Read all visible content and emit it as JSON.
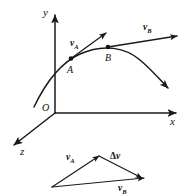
{
  "figure": {
    "type": "physics-vector-diagram",
    "background_color": "#ffffff",
    "stroke_color": "#1a1a1a"
  },
  "axes": {
    "y_label": "y",
    "x_label": "x",
    "z_label": "z",
    "origin_label": "O"
  },
  "curve": {
    "description": "trajectory-path",
    "points": [
      "A",
      "B"
    ]
  },
  "points": {
    "a_label": "A",
    "b_label": "B"
  },
  "vectors": {
    "v_a": {
      "symbol": "v",
      "subscript": "A"
    },
    "v_b": {
      "symbol": "v",
      "subscript": "B"
    }
  },
  "triangle": {
    "v_a": {
      "symbol": "v",
      "subscript": "A"
    },
    "v_b": {
      "symbol": "v",
      "subscript": "B"
    },
    "delta_v": {
      "delta": "Δ",
      "symbol": "v"
    }
  }
}
